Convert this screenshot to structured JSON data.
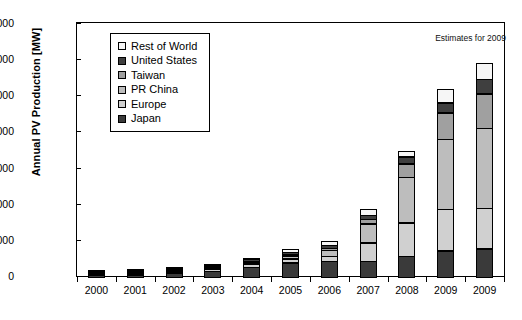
{
  "chart_data": {
    "type": "bar",
    "subtype": "stacked-vertical",
    "title": "",
    "xlabel": "",
    "ylabel": "Annual PV Production [MW]",
    "ylim": [
      0,
      14000
    ],
    "ytick_values": [
      0,
      2000,
      4000,
      6000,
      8000,
      10000,
      12000,
      14000
    ],
    "ytick_labels": [
      "0",
      "2000",
      "4000",
      "6000",
      "8000",
      "10000",
      "12000",
      "14000"
    ],
    "grid": false,
    "legend_position": "upper-left-inside",
    "annotation": "Estimates for 2009",
    "categories": [
      "2000",
      "2001",
      "2002",
      "2003",
      "2004",
      "2005",
      "2006",
      "2007",
      "2008",
      "2009",
      "2009"
    ],
    "stack_order_bottom_to_top": [
      "Japan",
      "Europe",
      "PR China",
      "Taiwan",
      "United States",
      "Rest of World"
    ],
    "series": [
      {
        "name": "Japan",
        "color": "#3a3a3a",
        "values": [
          130,
          170,
          250,
          365,
          600,
          830,
          925,
          920,
          1180,
          1500,
          1600
        ]
      },
      {
        "name": "Europe",
        "color": "#d0d0d0",
        "values": [
          25,
          35,
          60,
          140,
          205,
          265,
          290,
          1060,
          1900,
          2350,
          2300
        ]
      },
      {
        "name": "PR China",
        "color": "#bdbdbd",
        "values": [
          5,
          10,
          15,
          30,
          70,
          200,
          400,
          1080,
          2550,
          3900,
          4450
        ]
      },
      {
        "name": "Taiwan",
        "color": "#a0a0a0",
        "values": [
          0,
          0,
          5,
          10,
          30,
          75,
          135,
          300,
          800,
          1500,
          1950
        ]
      },
      {
        "name": "United States",
        "color": "#3f3f3f",
        "values": [
          75,
          75,
          100,
          105,
          140,
          155,
          200,
          270,
          420,
          600,
          850
        ]
      },
      {
        "name": "Rest of World",
        "color": "#f6f6f6",
        "values": [
          25,
          30,
          45,
          70,
          125,
          200,
          300,
          370,
          350,
          800,
          900
        ]
      }
    ],
    "totals": [
      260,
      320,
      475,
      720,
      1170,
      1725,
      2250,
      4000,
      7200,
      10650,
      12050
    ]
  },
  "legend": {
    "items": [
      {
        "label": "Rest of World",
        "color": "#f6f6f6"
      },
      {
        "label": "United States",
        "color": "#3f3f3f"
      },
      {
        "label": "Taiwan",
        "color": "#a0a0a0"
      },
      {
        "label": "PR China",
        "color": "#bdbdbd"
      },
      {
        "label": "Europe",
        "color": "#d0d0d0"
      },
      {
        "label": "Japan",
        "color": "#3a3a3a"
      }
    ]
  },
  "colors": {
    "axis": "#000000",
    "background": "#ffffff",
    "text": "#000000"
  }
}
